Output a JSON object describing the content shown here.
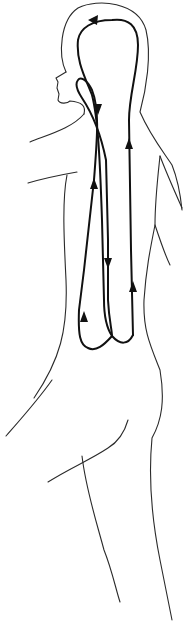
{
  "diagram": {
    "title": "Human figure in profile with circulation loop arrows",
    "colors": {
      "background": "#ffffff",
      "outline": "#2a2a2a",
      "flow": "#111111"
    },
    "elements": [
      {
        "id": "body-outline",
        "kind": "outline",
        "label": "body silhouette"
      },
      {
        "id": "outer-loop",
        "kind": "flow",
        "label": "outer loop over head"
      },
      {
        "id": "inner-loop",
        "kind": "flow",
        "label": "inner loop"
      }
    ],
    "arrows": [
      {
        "id": "a1",
        "x": 95,
        "y": 20,
        "direction": "left"
      },
      {
        "id": "a2",
        "x": 98,
        "y": 108,
        "direction": "down"
      },
      {
        "id": "a3",
        "x": 129,
        "y": 145,
        "direction": "up"
      },
      {
        "id": "a4",
        "x": 94,
        "y": 185,
        "direction": "up"
      },
      {
        "id": "a5",
        "x": 109,
        "y": 262,
        "direction": "down"
      },
      {
        "id": "a6",
        "x": 133,
        "y": 288,
        "direction": "up"
      },
      {
        "id": "a7",
        "x": 84,
        "y": 318,
        "direction": "up"
      }
    ]
  }
}
